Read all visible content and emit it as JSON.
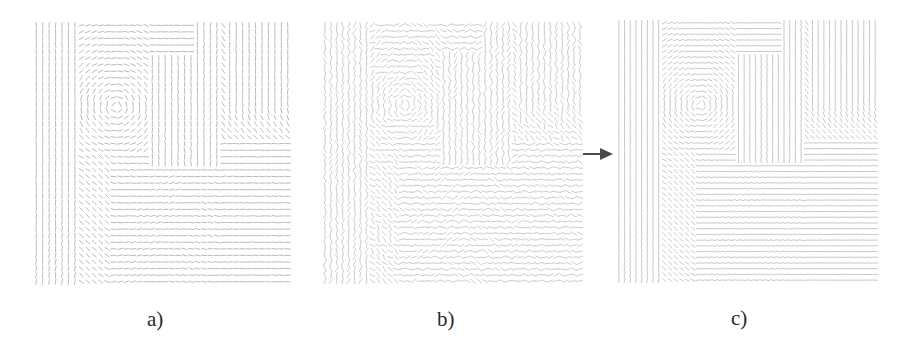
{
  "figure": {
    "background": "#ffffff",
    "panels": [
      {
        "id": "a",
        "label": "a)",
        "description": "original orientation field",
        "x": 33,
        "y": 22,
        "width": 258,
        "height": 263,
        "grid_cols": 40,
        "grid_rows": 40,
        "segment_length": 5.2,
        "stroke": "#9a9a9a",
        "stroke_opacity": 0.75,
        "noise": 0.12,
        "wavy": false,
        "label_x": 147,
        "label_y": 309
      },
      {
        "id": "b",
        "label": "b)",
        "description": "noisy orientation field",
        "x": 322,
        "y": 22,
        "width": 261,
        "height": 262,
        "grid_cols": 44,
        "grid_rows": 44,
        "segment_length": 5.8,
        "stroke": "#b0b0b0",
        "stroke_opacity": 0.7,
        "noise": 0.55,
        "wavy": true,
        "label_x": 437,
        "label_y": 309
      },
      {
        "id": "c",
        "label": "c)",
        "description": "smoothed orientation field",
        "x": 616,
        "y": 20,
        "width": 262,
        "height": 263,
        "grid_cols": 46,
        "grid_rows": 46,
        "segment_length": 5.0,
        "stroke": "#a8a8a8",
        "stroke_opacity": 0.7,
        "noise": 0.05,
        "wavy": false,
        "label_x": 731,
        "label_y": 308
      }
    ],
    "arrow": {
      "from_x": 583,
      "to_x": 613,
      "y": 154,
      "color": "#4a4a4a",
      "icon": "right-arrow-icon"
    }
  }
}
